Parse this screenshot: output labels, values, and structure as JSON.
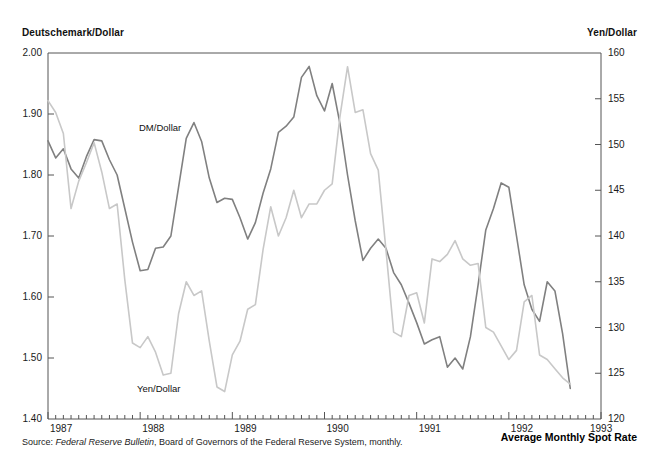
{
  "figure": {
    "left_axis_title": "Deutschemark/Dollar",
    "right_axis_title": "Yen/Dollar",
    "footer_right_label": "Average Monthly Spot Rate",
    "source_prefix": "Source:",
    "source_italic": "Federal Reserve Bulletin",
    "source_rest": ", Board of Governors of the Federal Reserve System, monthly.",
    "dm_label": "DM/Dollar",
    "yen_label": "Yen/Dollar",
    "dm_color": "#808080",
    "yen_color": "#c8c8c8",
    "axis_color": "#555555"
  },
  "chart_data": {
    "type": "line",
    "title": "Average Monthly Spot Rate",
    "xlabel": "",
    "ylabel": "Deutschemark/Dollar",
    "y2label": "Yen/Dollar",
    "grid": false,
    "legend": "inline-annotations",
    "xlim": [
      "1987-01",
      "1993-01"
    ],
    "ylim": [
      1.4,
      2.0
    ],
    "y2lim": [
      120,
      160
    ],
    "yticks": [
      1.4,
      1.5,
      1.6,
      1.7,
      1.8,
      1.9,
      2.0
    ],
    "ytick_labels": [
      "1.40",
      "1.50",
      "1.60",
      "1.70",
      "1.80",
      "1.90",
      "2.00"
    ],
    "y2ticks": [
      120,
      125,
      130,
      135,
      140,
      145,
      150,
      155,
      160
    ],
    "y2tick_labels": [
      "120",
      "125",
      "130",
      "135",
      "140",
      "145",
      "150",
      "155",
      "160"
    ],
    "xticks": [
      "1987",
      "1988",
      "1989",
      "1990",
      "1991",
      "1992",
      "1993"
    ],
    "xtick_labels": [
      "1987",
      "1988",
      "1989",
      "1990",
      "1991",
      "1992",
      "1993"
    ],
    "minor_x_ticks": "monthly",
    "x": [
      "1987-01",
      "1987-02",
      "1987-03",
      "1987-04",
      "1987-05",
      "1987-06",
      "1987-07",
      "1987-08",
      "1987-09",
      "1987-10",
      "1987-11",
      "1987-12",
      "1988-01",
      "1988-02",
      "1988-03",
      "1988-04",
      "1988-05",
      "1988-06",
      "1988-07",
      "1988-08",
      "1988-09",
      "1988-10",
      "1988-11",
      "1988-12",
      "1989-01",
      "1989-02",
      "1989-03",
      "1989-04",
      "1989-05",
      "1989-06",
      "1989-07",
      "1989-08",
      "1989-09",
      "1989-10",
      "1989-11",
      "1989-12",
      "1990-01",
      "1990-02",
      "1990-03",
      "1990-04",
      "1990-05",
      "1990-06",
      "1990-07",
      "1990-08",
      "1990-09",
      "1990-10",
      "1990-11",
      "1990-12",
      "1991-01",
      "1991-02",
      "1991-03",
      "1991-04",
      "1991-05",
      "1991-06",
      "1991-07",
      "1991-08",
      "1991-09",
      "1991-10",
      "1991-11",
      "1991-12",
      "1992-01",
      "1992-02",
      "1992-03",
      "1992-04",
      "1992-05",
      "1992-06",
      "1992-07",
      "1992-08",
      "1992-09"
    ],
    "series": [
      {
        "name": "DM/Dollar",
        "axis": "left",
        "color": "#808080",
        "values": [
          1.856,
          1.828,
          1.843,
          1.81,
          1.795,
          1.83,
          1.858,
          1.856,
          1.825,
          1.8,
          1.745,
          1.69,
          1.643,
          1.645,
          1.68,
          1.682,
          1.7,
          1.78,
          1.86,
          1.886,
          1.855,
          1.795,
          1.755,
          1.762,
          1.76,
          1.73,
          1.695,
          1.722,
          1.77,
          1.81,
          1.87,
          1.88,
          1.895,
          1.96,
          1.978,
          1.93,
          1.905,
          1.95,
          1.885,
          1.8,
          1.725,
          1.66,
          1.68,
          1.695,
          1.68,
          1.64,
          1.62,
          1.59,
          1.558,
          1.523,
          1.53,
          1.535,
          1.485,
          1.5,
          1.482,
          1.535,
          1.62,
          1.71,
          1.745,
          1.787,
          1.78,
          1.7,
          1.62,
          1.58,
          1.56,
          1.625,
          1.61,
          1.54,
          1.45
        ]
      },
      {
        "name": "Yen/Dollar",
        "axis": "right",
        "color": "#c8c8c8",
        "values": [
          154.8,
          153.5,
          151.2,
          143.0,
          146.0,
          148.0,
          150.2,
          147.0,
          143.0,
          143.5,
          135.2,
          128.3,
          127.8,
          129.0,
          127.3,
          124.8,
          125.0,
          131.5,
          135.0,
          133.5,
          134.0,
          128.5,
          123.5,
          123.0,
          127.0,
          128.5,
          132.0,
          132.5,
          138.5,
          143.2,
          140.0,
          142.0,
          145.0,
          142.0,
          143.5,
          143.5,
          145.0,
          145.7,
          153.0,
          158.5,
          153.5,
          153.8,
          149.0,
          147.2,
          138.5,
          129.5,
          129.0,
          133.5,
          133.8,
          130.5,
          137.5,
          137.2,
          138.0,
          139.5,
          137.5,
          136.8,
          137.0,
          130.0,
          129.5,
          128.0,
          126.5,
          127.5,
          132.8,
          133.5,
          127.0,
          126.5,
          125.5,
          124.5,
          123.8
        ]
      }
    ],
    "annotations": [
      {
        "text": "DM/Dollar",
        "x": "1988-05",
        "axis": "left"
      },
      {
        "text": "Yen/Dollar",
        "x": "1988-10",
        "axis": "right"
      }
    ]
  }
}
